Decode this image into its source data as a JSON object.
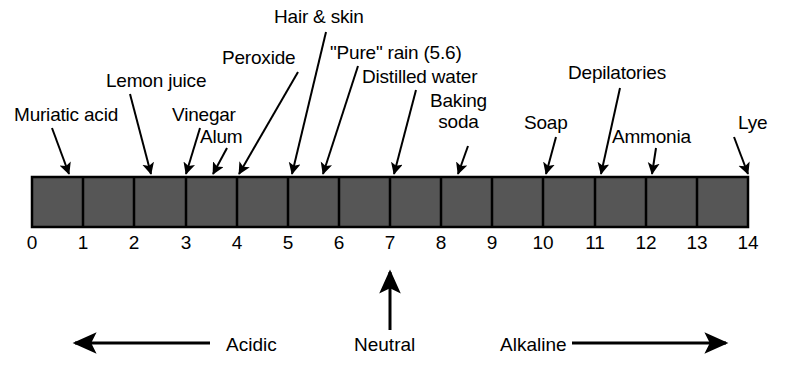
{
  "figure": {
    "bar": {
      "fill_color": "#565656",
      "stroke_color": "#000000",
      "x": 32,
      "y": 177,
      "width": 716,
      "height": 50,
      "min": 0,
      "max": 14
    }
  },
  "chart_data": {
    "type": "bar",
    "xlabel": "pH",
    "ylabel": "",
    "xlim": [
      0,
      14
    ],
    "grid": false,
    "legend": null,
    "categories": [
      "0",
      "1",
      "2",
      "3",
      "4",
      "5",
      "6",
      "7",
      "8",
      "9",
      "10",
      "11",
      "12",
      "13",
      "14"
    ],
    "tick_labels": [
      "0",
      "1",
      "2",
      "3",
      "4",
      "5",
      "6",
      "7",
      "8",
      "9",
      "10",
      "11",
      "12",
      "13",
      "14"
    ],
    "annotations": [
      {
        "label": "Muriatic acid",
        "ph": 0.72
      },
      {
        "label": "Lemon juice",
        "ph": 2.1
      },
      {
        "label": "Vinegar",
        "ph": 3.02
      },
      {
        "label": "Alum",
        "ph": 3.55
      },
      {
        "label": "Peroxide",
        "ph": 4.02
      },
      {
        "label": "Hair & skin",
        "ph": 5.08
      },
      {
        "label": "\"Pure\" rain (5.6)",
        "ph": 5.68
      },
      {
        "label": "Distilled water",
        "ph": 7.08
      },
      {
        "label": "Baking soda",
        "ph": 8.3
      },
      {
        "label": "Soap",
        "ph": 10.03
      },
      {
        "label": "Depilatories",
        "ph": 11.12
      },
      {
        "label": "Ammonia",
        "ph": 12.1
      },
      {
        "label": "Lye",
        "ph": 14.0
      }
    ]
  },
  "callouts": [
    {
      "name": "muriatic-acid",
      "text": "Muriatic acid",
      "lines": [
        "Muriatic acid"
      ],
      "x": 14,
      "y": 104,
      "tip_x": 69,
      "tip_y": 174,
      "tail_x": 52,
      "tail_y": 128
    },
    {
      "name": "lemon-juice",
      "text": "Lemon juice",
      "lines": [
        "Lemon juice"
      ],
      "x": 106,
      "y": 70,
      "tip_x": 151,
      "tip_y": 174,
      "tail_x": 130,
      "tail_y": 94
    },
    {
      "name": "vinegar",
      "text": "Vinegar",
      "lines": [
        "Vinegar"
      ],
      "x": 172,
      "y": 104,
      "tip_x": 186,
      "tip_y": 174,
      "tail_x": 200,
      "tail_y": 128
    },
    {
      "name": "alum",
      "text": "Alum",
      "lines": [
        "Alum"
      ],
      "x": 200,
      "y": 126,
      "tip_x": 213,
      "tip_y": 174,
      "tail_x": 227,
      "tail_y": 148
    },
    {
      "name": "peroxide",
      "text": "Peroxide",
      "lines": [
        "Peroxide"
      ],
      "x": 222,
      "y": 47,
      "tip_x": 239,
      "tip_y": 174,
      "tail_x": 298,
      "tail_y": 72
    },
    {
      "name": "hair-and-skin",
      "text": "Hair & skin",
      "lines": [
        "Hair & skin"
      ],
      "x": 274,
      "y": 6,
      "tip_x": 292,
      "tip_y": 174,
      "tail_x": 326,
      "tail_y": 32
    },
    {
      "name": "pure-rain",
      "text": "\"Pure\" rain (5.6)",
      "lines": [
        "\"Pure\" rain (5.6)"
      ],
      "x": 330,
      "y": 42,
      "tip_x": 323,
      "tip_y": 174,
      "tail_x": 358,
      "tail_y": 66
    },
    {
      "name": "distilled-water",
      "text": "Distilled water",
      "lines": [
        "Distilled water"
      ],
      "x": 362,
      "y": 66,
      "tip_x": 394,
      "tip_y": 174,
      "tail_x": 416,
      "tail_y": 90
    },
    {
      "name": "baking-soda",
      "text": "Baking soda",
      "lines": [
        "Baking",
        "soda"
      ],
      "x": 430,
      "y": 90,
      "tip_x": 458,
      "tip_y": 174,
      "tail_x": 468,
      "tail_y": 146
    },
    {
      "name": "soap",
      "text": "Soap",
      "lines": [
        "Soap"
      ],
      "x": 524,
      "y": 112,
      "tip_x": 546,
      "tip_y": 174,
      "tail_x": 556,
      "tail_y": 137
    },
    {
      "name": "depilatories",
      "text": "Depilatories",
      "lines": [
        "Depilatories"
      ],
      "x": 568,
      "y": 62,
      "tip_x": 601,
      "tip_y": 174,
      "tail_x": 620,
      "tail_y": 88
    },
    {
      "name": "ammonia",
      "text": "Ammonia",
      "lines": [
        "Ammonia"
      ],
      "x": 612,
      "y": 126,
      "tip_x": 652,
      "tip_y": 174,
      "tail_x": 656,
      "tail_y": 148
    },
    {
      "name": "lye",
      "text": "Lye",
      "lines": [
        "Lye"
      ],
      "x": 738,
      "y": 112,
      "tip_x": 748,
      "tip_y": 174,
      "tail_x": 734,
      "tail_y": 137
    }
  ],
  "ticks": [
    {
      "value": "0",
      "x": 32
    },
    {
      "value": "1",
      "x": 83
    },
    {
      "value": "2",
      "x": 134
    },
    {
      "value": "3",
      "x": 186
    },
    {
      "value": "4",
      "x": 237
    },
    {
      "value": "5",
      "x": 288
    },
    {
      "value": "6",
      "x": 339
    },
    {
      "value": "7",
      "x": 390
    },
    {
      "value": "8",
      "x": 441
    },
    {
      "value": "9",
      "x": 492
    },
    {
      "value": "10",
      "x": 543
    },
    {
      "value": "11",
      "x": 595
    },
    {
      "value": "12",
      "x": 646
    },
    {
      "value": "13",
      "x": 697
    },
    {
      "value": "14",
      "x": 748
    }
  ],
  "regions": {
    "acidic": {
      "label": "Acidic",
      "x": 226,
      "y": 335
    },
    "neutral": {
      "label": "Neutral",
      "x": 354,
      "y": 335
    },
    "alkaline": {
      "label": "Alkaline",
      "x": 500,
      "y": 335
    }
  }
}
